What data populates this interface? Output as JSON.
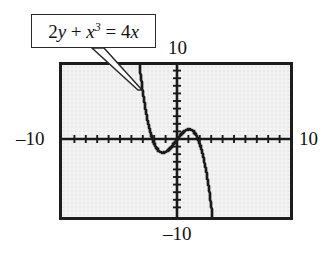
{
  "figure": {
    "name": "graphing-calculator-cubic-plot",
    "background_color": "#ffffff"
  },
  "callout": {
    "equation_plain": "2y + x^3 = 4x",
    "equation_parts": {
      "coefficient_y": "2",
      "var_y": "y",
      "plus": " + ",
      "var_x": "x",
      "exponent": "3",
      "equals": " = ",
      "coefficient_x": "4",
      "var_x2": "x"
    },
    "box_border_color": "#2a2a2a",
    "box_fill_color": "#ffffff",
    "pointer_target": "upper-left-branch-of-curve"
  },
  "screen": {
    "border_color": "#1c1c1c",
    "fill_color": "#e9e9e9",
    "axis_color": "#1a1a1a",
    "curve_color": "#1a1a1a",
    "labels": {
      "top": "10",
      "bottom": "–10",
      "left": "–10",
      "right": "10"
    }
  },
  "chart_data": {
    "type": "line",
    "xlabel": "",
    "ylabel": "",
    "xlim": [
      -10,
      10
    ],
    "ylim": [
      -10,
      10
    ],
    "grid": false,
    "legend": "none",
    "axis_tick_interval": 1,
    "x_tick_labels": [
      "–10",
      "10"
    ],
    "y_tick_labels": [
      "–10",
      "10"
    ],
    "series": [
      {
        "name": "y = 2x - x^3/2",
        "equation": "2y + x^3 = 4x",
        "x": [
          -3.2,
          -3.0,
          -2.8,
          -2.6,
          -2.4,
          -2.2,
          -2.0,
          -1.8,
          -1.6,
          -1.4,
          -1.2,
          -1.0,
          -0.8,
          -0.6,
          -0.4,
          -0.2,
          0.0,
          0.2,
          0.4,
          0.6,
          0.8,
          1.0,
          1.2,
          1.4,
          1.6,
          1.8,
          2.0,
          2.2,
          2.4,
          2.6,
          2.8,
          3.0,
          3.2
        ],
        "y": [
          10.0,
          7.5,
          5.37,
          3.58,
          2.11,
          0.92,
          0.0,
          -0.68,
          -1.15,
          -1.43,
          -1.54,
          -1.5,
          -1.34,
          -1.09,
          -0.77,
          -0.4,
          0.0,
          0.4,
          0.77,
          1.09,
          1.34,
          1.5,
          1.54,
          1.43,
          1.15,
          0.68,
          0.0,
          -0.92,
          -2.11,
          -3.58,
          -5.37,
          -7.5,
          -10.0
        ]
      }
    ],
    "annotations": [
      {
        "text": "2y + x³ = 4x",
        "kind": "callout-box",
        "points_to": "curve upper-left branch"
      }
    ],
    "features": {
      "x_intercepts": [
        -2,
        0,
        2
      ],
      "local_minimum": {
        "x": -1.1547,
        "y": -1.5396
      },
      "local_maximum": {
        "x": 1.1547,
        "y": 1.5396
      }
    }
  }
}
